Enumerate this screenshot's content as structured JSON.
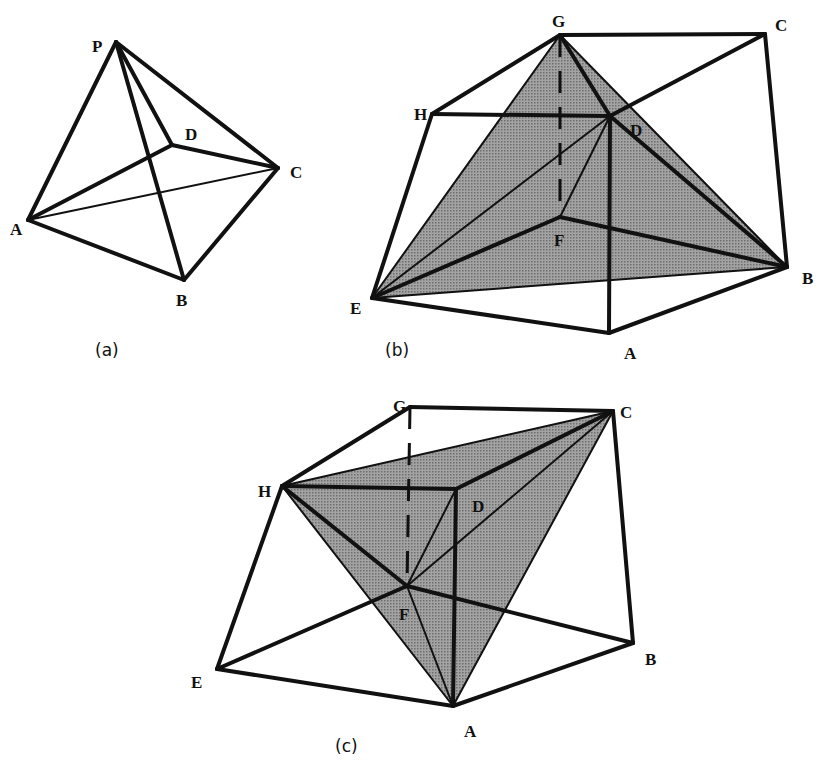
{
  "figures": [
    {
      "id": "a",
      "caption": "(a)",
      "caption_pos": [
        95,
        356
      ],
      "vertices": {
        "P": {
          "x": 116,
          "y": 42,
          "label": "P",
          "lx": 92,
          "ly": 52
        },
        "D": {
          "x": 172,
          "y": 145,
          "label": "D",
          "lx": 185,
          "ly": 140
        },
        "C": {
          "x": 278,
          "y": 168,
          "label": "C",
          "lx": 290,
          "ly": 178
        },
        "A": {
          "x": 28,
          "y": 220,
          "label": "A",
          "lx": 10,
          "ly": 235
        },
        "B": {
          "x": 184,
          "y": 280,
          "label": "B",
          "lx": 176,
          "ly": 306
        }
      },
      "shaded": [],
      "edges": [
        [
          "P",
          "A",
          "thick"
        ],
        [
          "P",
          "B",
          "thick"
        ],
        [
          "P",
          "C",
          "thick"
        ],
        [
          "P",
          "D",
          "thick"
        ],
        [
          "A",
          "D",
          "thick"
        ],
        [
          "D",
          "C",
          "thick"
        ],
        [
          "A",
          "B",
          "thick"
        ],
        [
          "B",
          "C",
          "thick"
        ],
        [
          "A",
          "C",
          "thin"
        ]
      ]
    },
    {
      "id": "b",
      "caption": "(b)",
      "caption_pos": [
        385,
        356
      ],
      "vertices": {
        "G": {
          "x": 560,
          "y": 35,
          "label": "G",
          "lx": 552,
          "ly": 27
        },
        "C": {
          "x": 765,
          "y": 34,
          "label": "C",
          "lx": 775,
          "ly": 31
        },
        "H": {
          "x": 432,
          "y": 114,
          "label": "H",
          "lx": 414,
          "ly": 120
        },
        "D": {
          "x": 610,
          "y": 116,
          "label": "D",
          "lx": 630,
          "ly": 136
        },
        "F": {
          "x": 560,
          "y": 217,
          "label": "F",
          "lx": 554,
          "ly": 246
        },
        "E": {
          "x": 372,
          "y": 298,
          "label": "E",
          "lx": 350,
          "ly": 314
        },
        "B": {
          "x": 787,
          "y": 267,
          "label": "B",
          "lx": 802,
          "ly": 284
        },
        "A": {
          "x": 609,
          "y": 333,
          "label": "A",
          "lx": 624,
          "ly": 359
        }
      },
      "shaded": [
        [
          "G",
          "E",
          "B"
        ]
      ],
      "edges": [
        [
          "G",
          "C",
          "thick"
        ],
        [
          "G",
          "H",
          "thick"
        ],
        [
          "H",
          "D",
          "thick"
        ],
        [
          "G",
          "D",
          "thick"
        ],
        [
          "D",
          "C",
          "thick"
        ],
        [
          "C",
          "B",
          "thick"
        ],
        [
          "H",
          "E",
          "thick"
        ],
        [
          "D",
          "B",
          "thick"
        ],
        [
          "E",
          "F",
          "thick"
        ],
        [
          "F",
          "B",
          "thick"
        ],
        [
          "E",
          "A",
          "thick"
        ],
        [
          "A",
          "B",
          "thick"
        ],
        [
          "D",
          "A",
          "thick"
        ],
        [
          "G",
          "E",
          "thin"
        ],
        [
          "E",
          "D",
          "thin"
        ],
        [
          "D",
          "F",
          "thin"
        ],
        [
          "E",
          "B",
          "thin"
        ],
        [
          "G",
          "B",
          "thin"
        ],
        [
          "G",
          "F",
          "dash"
        ]
      ]
    },
    {
      "id": "c",
      "caption": "(c)",
      "caption_pos": [
        335,
        752
      ],
      "vertices": {
        "G": {
          "x": 410,
          "y": 407,
          "label": "G",
          "lx": 393,
          "ly": 412
        },
        "C": {
          "x": 613,
          "y": 411,
          "label": "C",
          "lx": 620,
          "ly": 418
        },
        "H": {
          "x": 282,
          "y": 486,
          "label": "H",
          "lx": 258,
          "ly": 497
        },
        "D": {
          "x": 456,
          "y": 489,
          "label": "D",
          "lx": 472,
          "ly": 512
        },
        "F": {
          "x": 407,
          "y": 586,
          "label": "F",
          "lx": 399,
          "ly": 620
        },
        "E": {
          "x": 217,
          "y": 669,
          "label": "E",
          "lx": 191,
          "ly": 688
        },
        "B": {
          "x": 633,
          "y": 643,
          "label": "B",
          "lx": 645,
          "ly": 665
        },
        "A": {
          "x": 453,
          "y": 706,
          "label": "A",
          "lx": 464,
          "ly": 737
        }
      },
      "shaded": [
        [
          "H",
          "C",
          "A"
        ]
      ],
      "edges": [
        [
          "G",
          "C",
          "thick"
        ],
        [
          "G",
          "H",
          "thick"
        ],
        [
          "H",
          "D",
          "thick"
        ],
        [
          "D",
          "C",
          "thick"
        ],
        [
          "C",
          "B",
          "thick"
        ],
        [
          "H",
          "E",
          "thick"
        ],
        [
          "H",
          "F",
          "thick"
        ],
        [
          "E",
          "F",
          "thick"
        ],
        [
          "F",
          "B",
          "thick"
        ],
        [
          "E",
          "A",
          "thick"
        ],
        [
          "A",
          "B",
          "thick"
        ],
        [
          "D",
          "A",
          "thick"
        ],
        [
          "H",
          "C",
          "thin"
        ],
        [
          "H",
          "A",
          "thin"
        ],
        [
          "C",
          "A",
          "thin"
        ],
        [
          "F",
          "C",
          "thin"
        ],
        [
          "D",
          "F",
          "thin"
        ],
        [
          "F",
          "A",
          "thin"
        ],
        [
          "G",
          "F",
          "dash"
        ]
      ]
    }
  ],
  "colors": {
    "shade": "#9b9b9b",
    "shade_dot": "#6e6e6e",
    "stroke": "#111111"
  }
}
